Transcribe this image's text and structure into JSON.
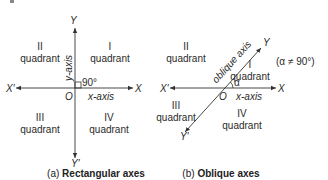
{
  "panel_a": {
    "x_pos_label": "X",
    "x_neg_label": "X′",
    "y_pos_label": "Y",
    "y_neg_label": "Y′",
    "origin_label": "O",
    "x_axis_label": "x-axis",
    "y_axis_label": "y-axis",
    "angle_label": "90°",
    "quadrants": {
      "q1": {
        "numeral": "I",
        "word": "quadrant"
      },
      "q2": {
        "numeral": "II",
        "word": "quadrant"
      },
      "q3": {
        "numeral": "III",
        "word": "quadrant"
      },
      "q4": {
        "numeral": "IV",
        "word": "quadrant"
      }
    },
    "caption_prefix": "(a)",
    "caption_title": "Rectangular axes"
  },
  "panel_b": {
    "x_pos_label": "X",
    "x_neg_label": "X′",
    "y_pos_label": "Y",
    "y_neg_label": "Y′",
    "origin_label": "O",
    "x_axis_label": "x-axis",
    "oblique_axis_label": "oblique axis",
    "angle_label": "α",
    "condition_label": "(α ≠ 90°)",
    "quadrants": {
      "q1": {
        "numeral": "I",
        "word": "quadrant"
      },
      "q2": {
        "numeral": "II",
        "word": "quadrant"
      },
      "q3": {
        "numeral": "III",
        "word": "quadrant"
      },
      "q4": {
        "numeral": "IV",
        "word": "quadrant"
      }
    },
    "caption_prefix": "(b)",
    "caption_title": "Oblique axes"
  }
}
